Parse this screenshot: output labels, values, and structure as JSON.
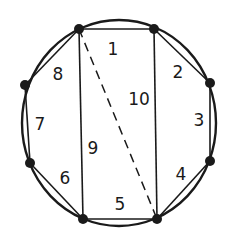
{
  "diagram": {
    "colors": {
      "stroke": "#1a1a1a",
      "background": "#ffffff"
    },
    "circle": {
      "cx": 119,
      "cy": 123,
      "rx": 97,
      "ry": 103
    },
    "vertices": [
      {
        "id": "A",
        "x": 79,
        "y": 29
      },
      {
        "id": "B",
        "x": 154,
        "y": 29
      },
      {
        "id": "C",
        "x": 210,
        "y": 83
      },
      {
        "id": "D",
        "x": 210,
        "y": 161
      },
      {
        "id": "E",
        "x": 157,
        "y": 219
      },
      {
        "id": "F",
        "x": 83,
        "y": 219
      },
      {
        "id": "G",
        "x": 30,
        "y": 163
      },
      {
        "id": "H",
        "x": 25,
        "y": 85
      }
    ],
    "labels": [
      {
        "text": "1",
        "x": 113,
        "y": 55
      },
      {
        "text": "2",
        "x": 178,
        "y": 78
      },
      {
        "text": "3",
        "x": 199,
        "y": 126
      },
      {
        "text": "4",
        "x": 181,
        "y": 180
      },
      {
        "text": "5",
        "x": 120,
        "y": 210
      },
      {
        "text": "6",
        "x": 65,
        "y": 184
      },
      {
        "text": "7",
        "x": 40,
        "y": 130
      },
      {
        "text": "8",
        "x": 58,
        "y": 80
      },
      {
        "text": "9",
        "x": 93,
        "y": 154
      },
      {
        "text": "10",
        "x": 139,
        "y": 105
      }
    ]
  }
}
